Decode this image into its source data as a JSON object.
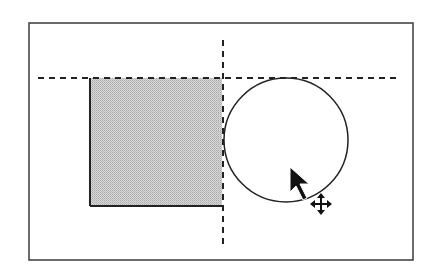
{
  "canvas": {
    "width": 430,
    "height": 270,
    "background": "#ffffff"
  },
  "frame": {
    "x1": 29,
    "y1": 23,
    "x2": 413,
    "y2": 260,
    "stroke": "#3a3a3a"
  },
  "guides": {
    "horizontal": {
      "x1": 38,
      "x2": 401,
      "y": 78,
      "stroke": "#222222"
    },
    "vertical": {
      "x": 223,
      "y1": 40,
      "y2": 244,
      "stroke": "#222222"
    }
  },
  "rectangle": {
    "x": 90,
    "y": 78,
    "width": 132,
    "height": 128,
    "fill": "#c8c8c8",
    "stroke": "#222222"
  },
  "circle": {
    "cx": 286,
    "cy": 140,
    "r": 62,
    "stroke": "#222222",
    "fill": "none"
  },
  "cursor": {
    "type": "arrow-with-move",
    "tip_x": 290,
    "tip_y": 167,
    "move_x": 321,
    "move_y": 204,
    "color": "#111111"
  }
}
